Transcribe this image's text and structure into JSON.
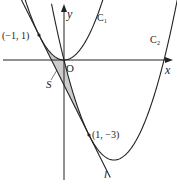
{
  "diagram": {
    "origin_px": [
      64,
      60
    ],
    "unit_px": 25,
    "colors": {
      "stroke": "#222222",
      "shade": "#cccccc",
      "background": "#ffffff"
    },
    "axes": {
      "x_label": "x",
      "y_label": "y",
      "origin_label": "O"
    },
    "curves": [
      {
        "name": "C1",
        "label": "C₁",
        "equation": "y = x^2"
      },
      {
        "name": "C2",
        "label": "C₂",
        "equation": "y = x^2 - 4x"
      }
    ],
    "line": {
      "name": "l",
      "label": "l",
      "equation": "y = -2x - 1"
    },
    "points": [
      {
        "label": "(−1, 1)",
        "x": -1,
        "y": 1
      },
      {
        "label": "(1, −3)",
        "x": 1,
        "y": -3
      }
    ],
    "region": {
      "label": "S"
    }
  }
}
